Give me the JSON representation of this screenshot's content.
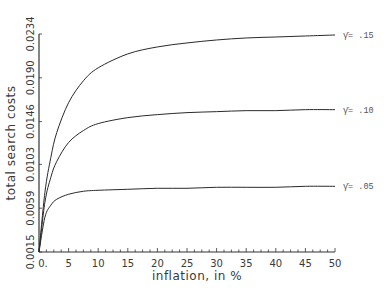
{
  "chart_data": {
    "type": "line",
    "title": "",
    "xlabel": "inflation, in %",
    "ylabel": "total search costs",
    "xlim": [
      0,
      50
    ],
    "ylim": [
      0.0015,
      0.0234
    ],
    "grid": false,
    "legend_position": "inline-right",
    "x_ticks": [
      "0.",
      "5",
      "10",
      "15",
      "20",
      "25",
      "30",
      "35",
      "40",
      "45",
      "50"
    ],
    "y_ticks": [
      "0.0015",
      "0.0059",
      "0.0103",
      "0.0146",
      "0.0190",
      "0.0234"
    ],
    "x": [
      0,
      1,
      2,
      3,
      5,
      7.5,
      10,
      15,
      20,
      25,
      30,
      35,
      40,
      45,
      50
    ],
    "series": [
      {
        "name": "γ̄= .15",
        "values": [
          0.0015,
          0.0075,
          0.011,
          0.0135,
          0.0165,
          0.0187,
          0.02,
          0.0214,
          0.0221,
          0.0225,
          0.0228,
          0.023,
          0.0231,
          0.0232,
          0.0233
        ]
      },
      {
        "name": "γ̄= .10",
        "values": [
          0.0015,
          0.0065,
          0.009,
          0.0106,
          0.0125,
          0.0137,
          0.0144,
          0.015,
          0.0153,
          0.0155,
          0.0156,
          0.0157,
          0.0157,
          0.0158,
          0.0158
        ]
      },
      {
        "name": "γ̄= .05",
        "values": [
          0.0015,
          0.005,
          0.0062,
          0.0068,
          0.0073,
          0.0076,
          0.0077,
          0.0078,
          0.0079,
          0.0079,
          0.008,
          0.008,
          0.008,
          0.0081,
          0.0081
        ]
      }
    ]
  },
  "labels": {
    "ylabel": "total search costs",
    "xlabel": "inflation, in %",
    "series_labels": [
      "γ̄= .15",
      "γ̄= .10",
      "γ̄= .05"
    ]
  }
}
